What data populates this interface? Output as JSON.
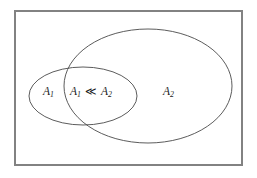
{
  "figure": {
    "type": "venn-diagram",
    "background_color": "#ffffff",
    "frame": {
      "label": "universe-frame",
      "stroke_color": "#828282",
      "stroke_width": 2,
      "x": 14,
      "y": 10,
      "width": 229,
      "height": 156
    },
    "stroke_color": "#4a4a4a",
    "text_color": "#1a1a1a",
    "sets": [
      {
        "id": "set-a1",
        "name": "A1",
        "shape": "ellipse",
        "cx": 83,
        "cy": 96,
        "rx": 54,
        "ry": 29
      },
      {
        "id": "set-a2",
        "name": "A2",
        "shape": "ellipse",
        "cx": 148,
        "cy": 86,
        "rx": 84,
        "ry": 57
      }
    ],
    "labels": [
      {
        "id": "label-a1",
        "base": "A",
        "sub": "1",
        "operator": "",
        "base2": "",
        "sub2": "",
        "x": 47,
        "y": 92,
        "region": "A1-only"
      },
      {
        "id": "label-intersection",
        "base": "A",
        "sub": "1",
        "operator": "≪",
        "base2": "A",
        "sub2": "2",
        "x": 74,
        "y": 92,
        "region": "A1-and-A2"
      },
      {
        "id": "label-a2",
        "base": "A",
        "sub": "2",
        "operator": "",
        "base2": "",
        "sub2": "",
        "x": 163,
        "y": 92,
        "region": "A2-only"
      }
    ]
  }
}
